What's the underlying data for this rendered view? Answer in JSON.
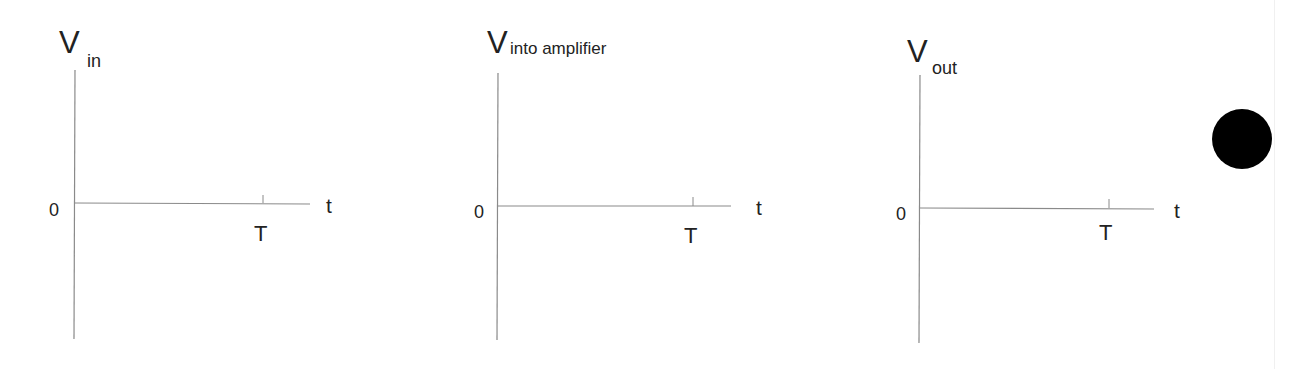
{
  "panels": [
    {
      "id": "vin",
      "title_main": "V",
      "title_sub": "in",
      "origin_label": "0",
      "x_axis_label": "t",
      "tick_label": "T"
    },
    {
      "id": "vinto",
      "title_main": "V",
      "title_sub": "into amplifier",
      "origin_label": "0",
      "x_axis_label": "t",
      "tick_label": "T"
    },
    {
      "id": "vout",
      "title_main": "V",
      "title_sub": "out",
      "origin_label": "0",
      "x_axis_label": "t",
      "tick_label": "T"
    }
  ],
  "marker": {
    "shape": "filled-circle",
    "color": "#000000"
  },
  "colors": {
    "axis": "#8a8a8a",
    "text": "#222222",
    "background": "#ffffff"
  }
}
